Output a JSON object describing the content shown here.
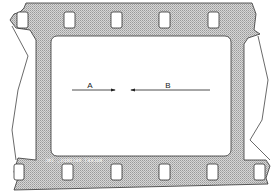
{
  "diagram": {
    "labels": {
      "a": "A",
      "b": "B"
    },
    "edge_text": "ROCKET RECORDS, INC",
    "edge_text_mirrored": true,
    "colors": {
      "film": "#c8c8c8",
      "outline": "#333333",
      "frame": "#ffffff",
      "arrow": "#222222"
    },
    "arrows": [
      {
        "label": "A",
        "direction": "right"
      },
      {
        "label": "B",
        "direction": "left"
      }
    ],
    "sprocket_holes_top": 5,
    "sprocket_holes_bottom": 6
  }
}
